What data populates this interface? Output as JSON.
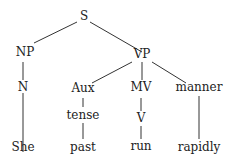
{
  "tree": {
    "root": "S",
    "nodes": {
      "S": "S",
      "NP": "NP",
      "VP": "VP",
      "N": "N",
      "Aux": "Aux",
      "MV": "MV",
      "manner": "manner",
      "tense": "tense",
      "V": "V",
      "She": "She",
      "past": "past",
      "run": "run",
      "rapidly": "rapidly"
    },
    "edges": [
      [
        "S",
        "NP"
      ],
      [
        "S",
        "VP"
      ],
      [
        "NP",
        "N"
      ],
      [
        "N",
        "She"
      ],
      [
        "VP",
        "Aux"
      ],
      [
        "VP",
        "MV"
      ],
      [
        "VP",
        "manner"
      ],
      [
        "Aux",
        "tense"
      ],
      [
        "tense",
        "past"
      ],
      [
        "MV",
        "V"
      ],
      [
        "V",
        "run"
      ],
      [
        "manner",
        "rapidly"
      ]
    ]
  },
  "colors": {
    "line": "#333333",
    "text": "#222222",
    "background": "#ffffff"
  }
}
